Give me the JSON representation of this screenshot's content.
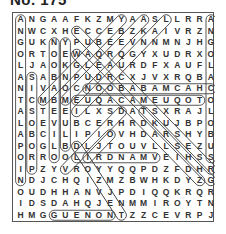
{
  "puzzle": {
    "title": "No. 175",
    "rows": [
      "ANGAAFKZMYAASLLRRA",
      "NWCXHECCEBZKAIVRZN",
      "GUKNYPUBEEVNNMNJHG",
      "ORTOEWAQRQGYXUDRXO",
      "LJAOKGLEAURDFXAUFL",
      "ASABNPUDRCXJVXRQBA",
      "NIVAOCNOOBABAMCAHC",
      "TCMBMEUQACAMEUQOTO",
      "ASTEEILXSDATSXRAJL",
      "LOEVUBCERHRDKUJBPO",
      "ABCILIPIOVHDARSHYB",
      "POGLBDLJTOUVLLSEZU",
      "ORROOLIRDNAMVEIHSS",
      "IPZYVROYYQQPDZFDHR",
      "NDJCHQIZMZBWHKDYZG",
      "OUDHHANVJPDIQQKRQR",
      "IDSDAHQJENMMIROYTN",
      "HMGGUENONTZZCEVRPJ"
    ],
    "found_words": [
      {
        "word": "ANGOLAN TALAPOIN",
        "r1": 0,
        "c1": 0,
        "r2": 14,
        "c2": 0
      },
      {
        "word": "PROBOSCIS",
        "r1": 5,
        "c1": 1,
        "r2": 13,
        "c2": 1
      },
      {
        "word": "OLIVE BABOON",
        "r1": 2,
        "c1": 3,
        "r2": 12,
        "c2": 3
      },
      {
        "word": "BLUE MONKEY",
        "r1": 2,
        "c1": 4,
        "r2": 11,
        "c2": 4
      },
      {
        "word": "ANGOLA COLOBUS",
        "r1": 0,
        "c1": 17,
        "r2": 12,
        "c2": 17
      },
      {
        "word": "CHACMA BABOON",
        "r1": 6,
        "c1": 6,
        "r2": 6,
        "c2": 17
      },
      {
        "word": "TOQUE MACAQUE",
        "r1": 7,
        "c1": 5,
        "r2": 7,
        "c2": 16
      },
      {
        "word": "MANDRILL",
        "r1": 12,
        "c1": 5,
        "r2": 12,
        "c2": 12
      },
      {
        "word": "GUENON",
        "r1": 17,
        "c1": 3,
        "r2": 17,
        "c2": 8
      },
      {
        "word": "diag-1",
        "r1": 0,
        "c1": 9,
        "r2": 7,
        "c2": 2
      },
      {
        "word": "diag-2",
        "r1": 0,
        "c1": 11,
        "r2": 7,
        "c2": 4
      },
      {
        "word": "diag-3",
        "r1": 0,
        "c1": 13,
        "r2": 8,
        "c2": 5
      },
      {
        "word": "diag-4",
        "r1": 1,
        "c1": 5,
        "r2": 13,
        "c2": 17
      },
      {
        "word": "diag-5",
        "r1": 3,
        "c1": 5,
        "r2": 14,
        "c2": 16
      },
      {
        "word": "diag-6",
        "r1": 8,
        "c1": 9,
        "r2": 13,
        "c2": 4
      },
      {
        "word": "diag-7",
        "r1": 11,
        "c1": 5,
        "r2": 17,
        "c2": 9
      },
      {
        "word": "diag-8",
        "r1": 8,
        "c1": 11,
        "r2": 14,
        "c2": 17
      },
      {
        "word": "diag-9",
        "r1": 10,
        "c1": 8,
        "r2": 12,
        "c2": 6
      }
    ]
  }
}
